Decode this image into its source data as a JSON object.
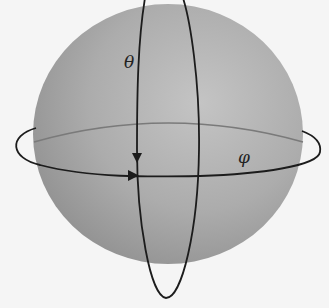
{
  "diagram": {
    "type": "sphere-coordinates",
    "labels": {
      "theta": "θ",
      "phi": "φ"
    },
    "elements": [
      {
        "id": "sphere",
        "shape": "shaded-sphere"
      },
      {
        "id": "vertical-ring",
        "shape": "meridian-loop",
        "label": "θ",
        "arrow": "down"
      },
      {
        "id": "horizontal-ring",
        "shape": "equator-loop",
        "label": "φ",
        "arrow": "right"
      }
    ],
    "colors": {
      "background": "#f5f5f5",
      "sphere_light": "#bdbdbd",
      "sphere_dark": "#8a8a8a",
      "line": "#1c1c1c",
      "back_line": "#7a7a7a"
    }
  }
}
